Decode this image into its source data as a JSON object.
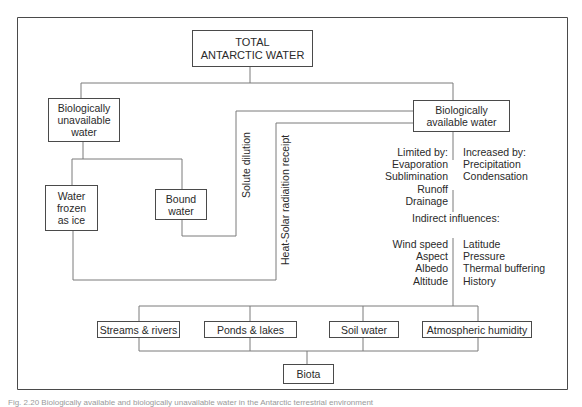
{
  "diagram": {
    "root": {
      "label": "TOTAL\nANTARCTIC WATER"
    },
    "unavailable": {
      "label": "Biologically\nunavailable\nwater"
    },
    "available": {
      "label": "Biologically\navailable water"
    },
    "frozen": {
      "label": "Water\nfrozen\nas ice"
    },
    "bound": {
      "label": "Bound\nwater"
    },
    "edge_labels": {
      "solute": "Solute dilution",
      "heat": "Heat-Solar radiaition receipt"
    },
    "limited_by": {
      "heading": "Limited by:",
      "items": [
        "Evaporation",
        "Sublimination",
        "Runoff",
        "Drainage"
      ]
    },
    "increased_by": {
      "heading": "Increased by:",
      "items": [
        "Precipitation",
        "Condensation"
      ]
    },
    "indirect": {
      "heading": "Indirect influences:",
      "left_items": [
        "Wind speed",
        "Aspect",
        "Albedo",
        "Altitude"
      ],
      "right_items": [
        "Latitude",
        "Pressure",
        "Thermal buffering",
        "History"
      ]
    },
    "reservoirs": [
      {
        "label": "Streams & rivers"
      },
      {
        "label": "Ponds & lakes"
      },
      {
        "label": "Soil water"
      },
      {
        "label": "Atmospheric humidity"
      }
    ],
    "biota": {
      "label": "Biota"
    }
  },
  "caption": "Fig. 2.20 Biologically available and biologically unavailable water in the Antarctic terrestrial environment"
}
